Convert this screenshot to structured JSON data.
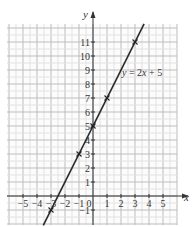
{
  "chart_data": {
    "type": "line",
    "title": "",
    "xlabel": "x",
    "ylabel": "y",
    "xlim": [
      -6,
      6
    ],
    "ylim": [
      -2,
      12.3
    ],
    "grid": true,
    "x_ticks": [
      "-5",
      "-4",
      "-3",
      "-2",
      "-1",
      "0",
      "1",
      "2",
      "3",
      "4",
      "5"
    ],
    "y_ticks": [
      "-1",
      "1",
      "2",
      "3",
      "4",
      "5",
      "6",
      "7",
      "8",
      "9",
      "10",
      "11"
    ],
    "series": [
      {
        "name": "y=2x+5",
        "equation": "y = 2x + 5",
        "line_color": "#2b2b2b",
        "marked_points": [
          {
            "x": -3,
            "y": -1
          },
          {
            "x": -1,
            "y": 3
          },
          {
            "x": 0,
            "y": 5
          },
          {
            "x": 1,
            "y": 7
          },
          {
            "x": 3,
            "y": 11
          }
        ]
      }
    ],
    "annotation": {
      "text_prefix": "y",
      "text_mid": " = 2",
      "text_var": "x",
      "text_suffix": " + 5"
    }
  }
}
